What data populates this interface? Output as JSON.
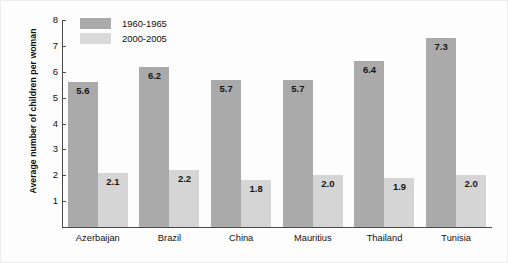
{
  "chart_data": {
    "type": "bar",
    "title": "",
    "xlabel": "",
    "ylabel": "Average number of children per woman",
    "ylim": [
      0,
      8
    ],
    "yticks": [
      1,
      2,
      3,
      4,
      5,
      6,
      7,
      8
    ],
    "grid": false,
    "legend_position": "top-left",
    "categories": [
      "Azerbaijan",
      "Brazil",
      "China",
      "Mauritius",
      "Thailand",
      "Tunisia"
    ],
    "series": [
      {
        "name": "1960-1965",
        "color": "#aaaaaa",
        "values": [
          5.6,
          6.2,
          5.7,
          5.7,
          6.4,
          7.3
        ],
        "labels": [
          "5.6",
          "6.2",
          "5.7",
          "5.7",
          "6.4",
          "7.3"
        ]
      },
      {
        "name": "2000-2005",
        "color": "#d5d5d5",
        "values": [
          2.1,
          2.2,
          1.8,
          2.0,
          1.9,
          2.0
        ],
        "labels": [
          "2.1",
          "2.2",
          "1.8",
          "2.0",
          "1.9",
          "2.0"
        ]
      }
    ]
  },
  "axis": {
    "y_title": "Average number of children per woman",
    "y_tick_labels": [
      "8",
      "7",
      "6",
      "5",
      "4",
      "3",
      "2",
      "1"
    ]
  },
  "legend": {
    "entries": [
      {
        "label": "1960-1965"
      },
      {
        "label": "2000-2005"
      }
    ]
  }
}
